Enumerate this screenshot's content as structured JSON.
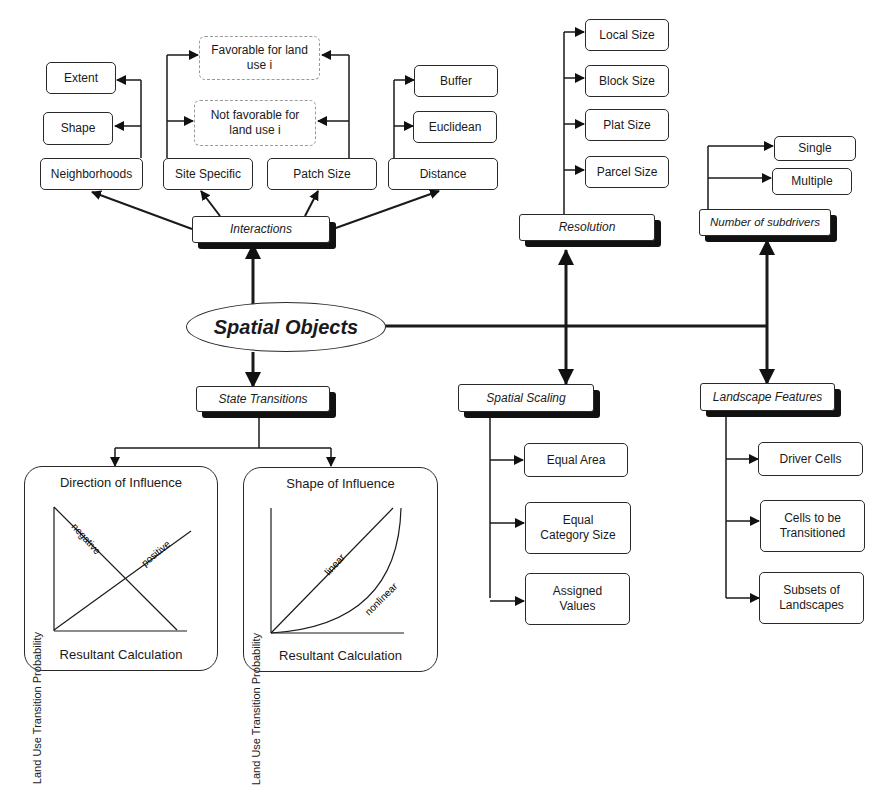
{
  "center": {
    "label": "Spatial Objects"
  },
  "interactions": {
    "label": "Interactions",
    "children": {
      "neighborhoods": {
        "label": "Neighborhoods",
        "children": [
          "Extent",
          "Shape"
        ]
      },
      "site_specific": {
        "label": "Site Specific"
      },
      "patch_size": {
        "label": "Patch Size"
      },
      "distance": {
        "label": "Distance",
        "children": [
          "Buffer",
          "Euclidean"
        ]
      }
    },
    "shared_outcomes": [
      "Favorable for land use  i",
      "Not favorable for land use i"
    ]
  },
  "resolution": {
    "label": "Resolution",
    "children": [
      "Local Size",
      "Block Size",
      "Plat Size",
      "Parcel Size"
    ]
  },
  "subdrivers": {
    "label": "Number of subdrivers",
    "children": [
      "Single",
      "Multiple"
    ]
  },
  "state_transitions": {
    "label": "State Transitions",
    "panels": [
      {
        "title": "Direction of Influence",
        "xlabel": "Resultant Calculation",
        "ylabel": "Land Use Transition Probability",
        "curves": [
          "negative",
          "positive"
        ]
      },
      {
        "title": "Shape of Influence",
        "xlabel": "Resultant Calculation",
        "ylabel": "Land Use Transition Probability",
        "curves": [
          "linear",
          "nonlinear"
        ]
      }
    ]
  },
  "spatial_scaling": {
    "label": "Spatial Scaling",
    "children": [
      "Equal Area",
      "Equal Category Size",
      "Assigned Values"
    ]
  },
  "landscape_features": {
    "label": "Landscape Features",
    "children": [
      "Driver Cells",
      "Cells to be Transitioned",
      "Subsets of Landscapes"
    ]
  }
}
